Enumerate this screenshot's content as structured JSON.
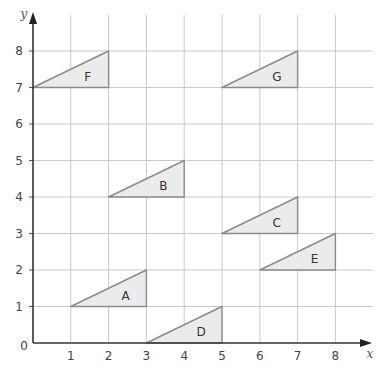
{
  "axes": {
    "x_label": "x",
    "y_label": "y",
    "origin_label": "0",
    "x_ticks": [
      "1",
      "2",
      "3",
      "4",
      "5",
      "6",
      "7",
      "8"
    ],
    "y_ticks": [
      "1",
      "2",
      "3",
      "4",
      "5",
      "6",
      "7",
      "8"
    ],
    "x_range": [
      0,
      8
    ],
    "y_range": [
      0,
      8
    ]
  },
  "colors": {
    "triangle_fill": "#ebebeb",
    "triangle_stroke": "#8a8a8a",
    "grid": "#c8c8c8",
    "axis": "#333333"
  },
  "triangles": [
    {
      "label": "A",
      "vertices": [
        [
          1,
          1
        ],
        [
          3,
          1
        ],
        [
          3,
          2
        ]
      ]
    },
    {
      "label": "B",
      "vertices": [
        [
          2,
          4
        ],
        [
          4,
          4
        ],
        [
          4,
          5
        ]
      ]
    },
    {
      "label": "C",
      "vertices": [
        [
          5,
          3
        ],
        [
          7,
          3
        ],
        [
          7,
          4
        ]
      ]
    },
    {
      "label": "D",
      "vertices": [
        [
          3,
          0
        ],
        [
          5,
          0
        ],
        [
          5,
          1
        ]
      ]
    },
    {
      "label": "E",
      "vertices": [
        [
          6,
          2
        ],
        [
          8,
          2
        ],
        [
          8,
          3
        ]
      ]
    },
    {
      "label": "F",
      "vertices": [
        [
          0,
          7
        ],
        [
          2,
          7
        ],
        [
          2,
          8
        ]
      ]
    },
    {
      "label": "G",
      "vertices": [
        [
          5,
          7
        ],
        [
          7,
          7
        ],
        [
          7,
          8
        ]
      ]
    }
  ]
}
